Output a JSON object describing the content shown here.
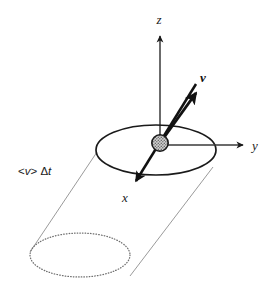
{
  "figure": {
    "background_color": "#ffffff",
    "width": 274,
    "height": 296
  },
  "labels": {
    "z_axis": "z",
    "y_axis": "y",
    "x_axis": "x",
    "velocity_vector": "v",
    "cylinder_length_prefix": "<",
    "cylinder_length_speed": "v",
    "cylinder_length_mid": ">",
    "cylinder_length_delta": " Δ",
    "cylinder_length_time": "t",
    "cylinder_length_full": "<v> Δt"
  },
  "colors": {
    "stroke_dark": "#1a1a1a",
    "stroke_thin": "#8c8c8c",
    "dotted": "#6e6e6e",
    "particle_fill": "#b8b8b8",
    "particle_stroke": "#1a1a1a",
    "text": "#1a1a1a"
  },
  "geometry": {
    "top_ellipse": {
      "cx": 156,
      "cy": 150,
      "rx": 60,
      "ry": 25,
      "style": "solid"
    },
    "bottom_ellipse": {
      "cx": 80,
      "cy": 255,
      "rx": 50,
      "ry": 22,
      "style": "dotted"
    },
    "side_line_left": {
      "x1": 97,
      "y1": 152,
      "x2": 30,
      "y2": 252
    },
    "side_line_right": {
      "x1": 213,
      "y1": 167,
      "x2": 130,
      "y2": 276
    },
    "particle": {
      "cx": 160,
      "cy": 143,
      "r": 8
    },
    "z_axis": {
      "x1": 160,
      "y1": 143,
      "x2": 160,
      "y2": 36
    },
    "y_axis": {
      "x1": 164,
      "y1": 145,
      "x2": 243,
      "y2": 145
    },
    "x_axis": {
      "x1": 196,
      "y1": 84,
      "x2": 134,
      "y2": 184
    },
    "velocity_vector": {
      "x1": 160,
      "y1": 143,
      "x2": 197,
      "y2": 92
    }
  },
  "label_positions": {
    "z": {
      "x": 159,
      "y": 24
    },
    "y": {
      "x": 252,
      "y": 150
    },
    "x": {
      "x": 125,
      "y": 202
    },
    "v": {
      "x": 203,
      "y": 82
    },
    "length": {
      "x": 18,
      "y": 175
    }
  }
}
